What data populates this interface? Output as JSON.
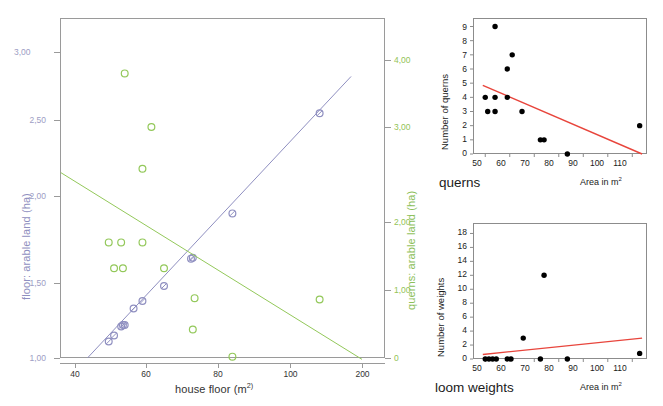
{
  "colors": {
    "floor_series": "#8f8fc0",
    "querns_series": "#93c85a",
    "regression_red": "#e8453c",
    "axis_gray": "#8c8c8c",
    "text": "#1b1b1b"
  },
  "main_chart": {
    "xlabel": "house floor (m",
    "xlabel_sup": "2)",
    "ylabel_left": "floor: arable land (ha)",
    "ylabel_right": "querns: arable land (ha)",
    "xticks": [
      "40",
      "60",
      "80",
      "100",
      "200"
    ],
    "yticks_left": [
      "1,00",
      "1,50",
      "2,00",
      "2,50",
      "3,00"
    ],
    "yticks_right": [
      "0",
      "1,00",
      "2,00",
      "3,00",
      "4,00"
    ]
  },
  "querns_chart": {
    "title": "querns",
    "ylabel": "Number of querns",
    "xlabel": "Area in m",
    "xlabel_sup": "2",
    "yticks": [
      "0",
      "1",
      "2",
      "3",
      "4",
      "5",
      "6",
      "7",
      "8",
      "9"
    ],
    "xticks": [
      "50",
      "60",
      "70",
      "80",
      "90",
      "100",
      "110"
    ]
  },
  "weights_chart": {
    "title": "loom weights",
    "ylabel": "Number of weights",
    "xlabel": "Area in m",
    "xlabel_sup": "2",
    "yticks": [
      "0",
      "2",
      "4",
      "6",
      "8",
      "10",
      "12",
      "14",
      "16",
      "18"
    ],
    "xticks": [
      "50",
      "60",
      "70",
      "80",
      "90",
      "100",
      "110"
    ]
  },
  "chart_data": [
    {
      "id": "main",
      "type": "scatter",
      "title": "",
      "xlabel": "house floor (m2)",
      "ylabel": "floor: arable land (ha)",
      "ylabel_secondary": "querns: arable land (ha)",
      "xscale": "log-like",
      "xticks": [
        40,
        60,
        80,
        100,
        200
      ],
      "ylim_left": [
        1.0,
        3.0
      ],
      "yticks_left": [
        1.0,
        1.5,
        2.0,
        2.5,
        3.0
      ],
      "ylim_right": [
        0,
        4.0
      ],
      "yticks_right": [
        0,
        1.0,
        2.0,
        3.0,
        4.0
      ],
      "grid": false,
      "legend": "none",
      "series": [
        {
          "name": "floor: arable land (ha)",
          "axis": "left",
          "color": "#8f8fc0",
          "marker": "circle-with-slash",
          "points": [
            {
              "x": 49.5,
              "y": 1.11
            },
            {
              "x": 51.0,
              "y": 1.15
            },
            {
              "x": 53.0,
              "y": 1.21
            },
            {
              "x": 53.5,
              "y": 1.22
            },
            {
              "x": 54.0,
              "y": 1.22
            },
            {
              "x": 56.5,
              "y": 1.33
            },
            {
              "x": 59.0,
              "y": 1.38
            },
            {
              "x": 65.0,
              "y": 1.48
            },
            {
              "x": 72.5,
              "y": 1.64
            },
            {
              "x": 73.0,
              "y": 1.645
            },
            {
              "x": 84.0,
              "y": 1.9
            },
            {
              "x": 133.0,
              "y": 2.55
            }
          ],
          "trend": {
            "from": {
              "x": 43.5,
              "y": 1.0
            },
            "to": {
              "x": 180.0,
              "y": 2.82
            }
          }
        },
        {
          "name": "querns: arable land (ha)",
          "axis": "right",
          "color": "#93c85a",
          "marker": "open-circle",
          "points": [
            {
              "x": 54.0,
              "y": 3.8
            },
            {
              "x": 61.5,
              "y": 3.0
            },
            {
              "x": 59.0,
              "y": 2.56
            },
            {
              "x": 49.5,
              "y": 1.7
            },
            {
              "x": 53.0,
              "y": 1.7
            },
            {
              "x": 59.0,
              "y": 1.7
            },
            {
              "x": 51.0,
              "y": 1.32
            },
            {
              "x": 53.5,
              "y": 1.32
            },
            {
              "x": 65.0,
              "y": 1.32
            },
            {
              "x": 73.5,
              "y": 0.88
            },
            {
              "x": 133.0,
              "y": 0.86
            },
            {
              "x": 73.0,
              "y": 0.42
            },
            {
              "x": 84.0,
              "y": 0.02
            }
          ],
          "trend": {
            "from": {
              "x": 36.0,
              "y": 2.52
            },
            "to": {
              "x": 200.0,
              "y": -0.02
            }
          }
        }
      ]
    },
    {
      "id": "querns",
      "type": "scatter",
      "title": "querns",
      "xlabel": "Area in m2",
      "ylabel": "Number of querns",
      "xlim": [
        45,
        116
      ],
      "ylim": [
        0,
        9.6
      ],
      "xticks": [
        50,
        60,
        70,
        80,
        90,
        100,
        110
      ],
      "yticks": [
        0,
        1,
        2,
        3,
        4,
        5,
        6,
        7,
        8,
        9
      ],
      "grid": false,
      "legend": "none",
      "marker_color": "#000000",
      "points": [
        {
          "x": 54,
          "y": 9
        },
        {
          "x": 61,
          "y": 7
        },
        {
          "x": 59,
          "y": 6
        },
        {
          "x": 50,
          "y": 4
        },
        {
          "x": 54,
          "y": 4
        },
        {
          "x": 59,
          "y": 4
        },
        {
          "x": 51,
          "y": 3
        },
        {
          "x": 54,
          "y": 3
        },
        {
          "x": 65,
          "y": 3
        },
        {
          "x": 113,
          "y": 2
        },
        {
          "x": 72.5,
          "y": 1
        },
        {
          "x": 74,
          "y": 1
        },
        {
          "x": 83.5,
          "y": 0
        }
      ],
      "trendline": {
        "color": "#e8453c",
        "from": {
          "x": 49,
          "y": 4.85
        },
        "to": {
          "x": 114,
          "y": 0.0
        }
      }
    },
    {
      "id": "loom-weights",
      "type": "scatter",
      "title": "loom weights",
      "xlabel": "Area in m2",
      "ylabel": "Number of weights",
      "xlim": [
        45,
        116
      ],
      "ylim": [
        0,
        19.5
      ],
      "xticks": [
        50,
        60,
        70,
        80,
        90,
        100,
        110
      ],
      "yticks": [
        0,
        2,
        4,
        6,
        8,
        10,
        12,
        14,
        16,
        18
      ],
      "grid": false,
      "legend": "none",
      "marker_color": "#000000",
      "points": [
        {
          "x": 74,
          "y": 12
        },
        {
          "x": 65.5,
          "y": 3
        },
        {
          "x": 113,
          "y": 0.8
        },
        {
          "x": 50,
          "y": 0
        },
        {
          "x": 51.5,
          "y": 0
        },
        {
          "x": 53,
          "y": 0
        },
        {
          "x": 54.5,
          "y": 0
        },
        {
          "x": 59,
          "y": 0
        },
        {
          "x": 60.5,
          "y": 0
        },
        {
          "x": 72.5,
          "y": 0
        },
        {
          "x": 83.5,
          "y": 0
        }
      ],
      "trendline": {
        "color": "#e8453c",
        "from": {
          "x": 49,
          "y": 0.65
        },
        "to": {
          "x": 114,
          "y": 3.0
        }
      }
    }
  ]
}
